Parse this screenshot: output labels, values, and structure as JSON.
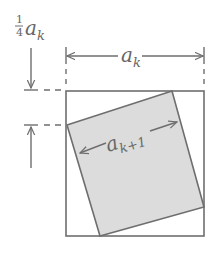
{
  "diagram": {
    "colors": {
      "line": "#6e6e6e",
      "fill": "#dcdcdc",
      "text": "#666666",
      "background": "#ffffff"
    },
    "labels": {
      "quarter_numerator": "1",
      "quarter_denominator": "4",
      "quarter_var": "a",
      "quarter_sub": "k",
      "outer_var": "a",
      "outer_sub": "k",
      "inner_var": "a",
      "inner_sub": "k+1"
    },
    "outer_square": {
      "x": 66,
      "y": 91,
      "width": 138,
      "height": 145
    },
    "inner_square": {
      "vertices": [
        [
          67,
          125
        ],
        [
          172,
          91
        ],
        [
          204,
          207
        ],
        [
          100,
          236
        ]
      ]
    }
  }
}
